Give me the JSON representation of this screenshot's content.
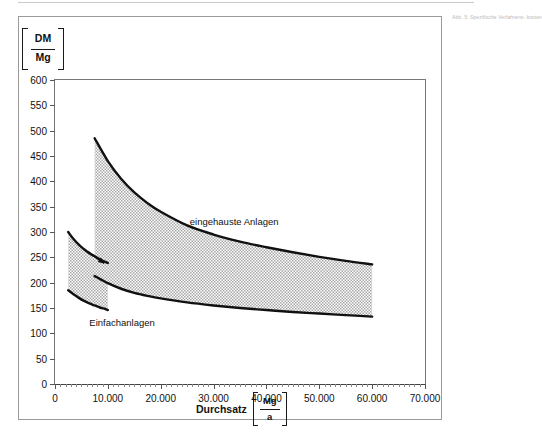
{
  "figure": {
    "margin_note": "Abb. 5:\nSpezifische\nVerfahrens-\nkosten"
  },
  "yaxis": {
    "unit_numerator": "DM",
    "unit_denominator": "Mg",
    "ticks": [
      0,
      50,
      100,
      150,
      200,
      250,
      300,
      350,
      400,
      450,
      500,
      550,
      600
    ],
    "tick_labels": [
      "0",
      "50",
      "100",
      "150",
      "200",
      "250",
      "300",
      "350",
      "400",
      "450",
      "500",
      "550",
      "600"
    ],
    "min": 0,
    "max": 600
  },
  "xaxis": {
    "title": "Durchsatz",
    "unit_numerator": "Mg",
    "unit_denominator": "a",
    "ticks": [
      0,
      10000,
      20000,
      30000,
      40000,
      50000,
      60000,
      70000
    ],
    "tick_labels": [
      "0",
      "10.000",
      "20.000",
      "30.000",
      "40.000",
      "50.000",
      "60.000",
      "70.000"
    ],
    "min": 0,
    "max": 70000
  },
  "labels": {
    "band_upper": "eingehauste Anlagen",
    "band_lower": "Einfachanlagen"
  },
  "colors": {
    "curve": "#111111",
    "band_fill": "#d9d9d9",
    "axis": "#555555",
    "frame": "#9a9a9a"
  },
  "chart_data": {
    "type": "area",
    "title": "",
    "subtitle": "",
    "xlabel": "Durchsatz [Mg/a]",
    "ylabel": "[DM/Mg]",
    "xlim": [
      0,
      70000
    ],
    "ylim": [
      0,
      600
    ],
    "grid": false,
    "legend_position": "inline-annotation",
    "series": [
      {
        "name": "eingehauste Anlagen – obere Grenze",
        "kind": "band-upper",
        "x": [
          7500,
          10000,
          12500,
          15000,
          17500,
          20000,
          25000,
          30000,
          35000,
          40000,
          45000,
          50000,
          55000,
          60000
        ],
        "y": [
          485,
          440,
          405,
          378,
          357,
          340,
          313,
          295,
          281,
          270,
          260,
          251,
          243,
          236
        ]
      },
      {
        "name": "eingehauste Anlagen – untere Grenze",
        "kind": "band-lower",
        "x": [
          7500,
          10000,
          12500,
          15000,
          17500,
          20000,
          25000,
          30000,
          35000,
          40000,
          45000,
          50000,
          55000,
          60000
        ],
        "y": [
          213,
          199,
          188,
          180,
          174,
          169,
          161,
          155,
          150,
          146,
          142,
          139,
          136,
          133
        ]
      },
      {
        "name": "Einfachanlagen – obere Grenze",
        "kind": "band-upper",
        "x": [
          2500,
          3500,
          4500,
          5500,
          6500,
          7500,
          8500,
          9500,
          10000
        ],
        "y": [
          300,
          286,
          275,
          266,
          258,
          252,
          246,
          241,
          239
        ]
      },
      {
        "name": "Einfachanlagen – untere Grenze",
        "kind": "band-lower",
        "x": [
          2500,
          3500,
          4500,
          5500,
          6500,
          7500,
          8500,
          9500,
          10000
        ],
        "y": [
          185,
          177,
          170,
          164,
          159,
          155,
          151,
          148,
          146
        ]
      }
    ],
    "annotations": [
      {
        "text": "eingehauste Anlagen",
        "x": 25500,
        "y": 318
      },
      {
        "text": "Einfachanlagen",
        "x": 6500,
        "y": 118
      },
      {
        "text": "arrow",
        "x": 9000,
        "y": 245
      }
    ]
  }
}
